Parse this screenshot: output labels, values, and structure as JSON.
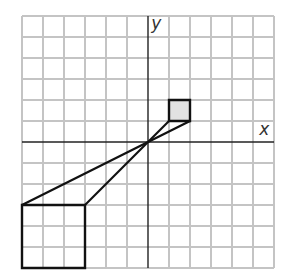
{
  "diagram": {
    "type": "coordinate-grid-dilation",
    "grid": {
      "x_min": -6,
      "x_max": 6,
      "y_min": -6,
      "y_max": 6,
      "cell_px": 21,
      "origin_px": [
        148,
        142
      ],
      "grid_color": "#c4c4c4",
      "axis_color": "#222222"
    },
    "axes": {
      "x_label": "x",
      "y_label": "y"
    },
    "shapes": [
      {
        "name": "small-quadrilateral",
        "vertices": [
          [
            1,
            1
          ],
          [
            1,
            2
          ],
          [
            2,
            2
          ],
          [
            2,
            1
          ]
        ],
        "fill": "#e2e2e2",
        "stroke": "#111111"
      },
      {
        "name": "large-quadrilateral",
        "vertices": [
          [
            -3,
            -3
          ],
          [
            -3,
            -6
          ],
          [
            -6,
            -6
          ],
          [
            -6,
            -3
          ]
        ],
        "fill": "none",
        "stroke": "#111111"
      }
    ],
    "rays": [
      {
        "from": [
          2,
          1
        ],
        "to": [
          -6,
          -3
        ]
      },
      {
        "from": [
          1,
          1
        ],
        "to": [
          -3,
          -3
        ]
      }
    ]
  }
}
